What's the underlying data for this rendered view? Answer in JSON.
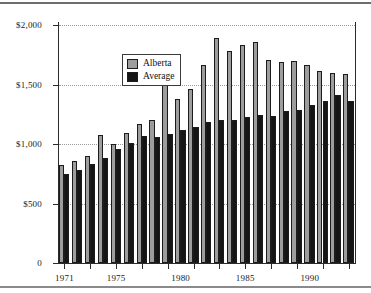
{
  "chart_data": {
    "type": "bar",
    "title": "",
    "xlabel": "",
    "ylabel": "",
    "ylim": [
      0,
      2000
    ],
    "yticks": [
      0,
      500,
      1000,
      1500,
      2000
    ],
    "ytick_labels": [
      "0",
      "$500",
      "$1,000",
      "$1,500",
      "$2,000"
    ],
    "grid": true,
    "gridlines_at": [
      500,
      1000,
      1500,
      2000
    ],
    "legend_position": "upper-left",
    "categories": [
      "1971",
      "1972",
      "1973",
      "1974",
      "1975",
      "1976",
      "1977",
      "1978",
      "1979",
      "1980",
      "1981",
      "1982",
      "1983",
      "1984",
      "1985",
      "1986",
      "1987",
      "1988",
      "1989",
      "1990",
      "1991",
      "1992",
      "1993"
    ],
    "xtick_labels": [
      "1971",
      "1975",
      "1980",
      "1985",
      "1990"
    ],
    "xtick_categories": [
      "1971",
      "1975",
      "1980",
      "1985",
      "1990"
    ],
    "series": [
      {
        "name": "Alberta",
        "color": "#9d9d9d",
        "values": [
          820,
          860,
          900,
          1075,
          1000,
          1095,
          1165,
          1200,
          1495,
          1375,
          1460,
          1660,
          1890,
          1785,
          1830,
          1855,
          1705,
          1690,
          1700,
          1665,
          1610,
          1600,
          1585
        ]
      },
      {
        "name": "Average",
        "color": "#151515",
        "values": [
          750,
          785,
          830,
          885,
          960,
          1010,
          1065,
          1060,
          1085,
          1115,
          1140,
          1185,
          1200,
          1200,
          1225,
          1240,
          1235,
          1275,
          1285,
          1330,
          1360,
          1415,
          1360
        ]
      }
    ]
  }
}
